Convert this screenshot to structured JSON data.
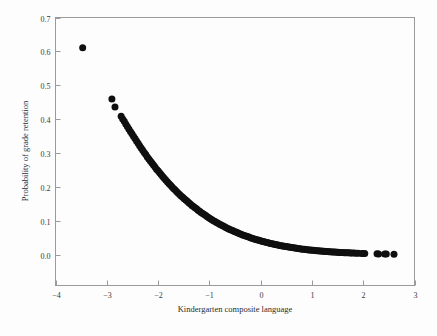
{
  "chart_data": {
    "type": "scatter",
    "title": "",
    "xlabel": "Kindergarten composite language",
    "ylabel": "Probability of grade retention",
    "xlim": [
      -4,
      3
    ],
    "ylim": [
      -0.09,
      0.7
    ],
    "xticks": [
      -4,
      -3,
      -2,
      -1,
      0,
      1,
      2,
      3
    ],
    "xticklabels": [
      "−4",
      "−3",
      "−2",
      "−1",
      "0",
      "1",
      "2",
      "3"
    ],
    "yticks": [
      0.0,
      0.1,
      0.2,
      0.3,
      0.4,
      0.5,
      0.6,
      0.7
    ],
    "yticklabels": [
      "0.0",
      "0.1",
      "0.2",
      "0.3",
      "0.4",
      "0.5",
      "0.6",
      "0.7"
    ],
    "grid": false,
    "legend": false,
    "marker": "filled-circle",
    "marker_color": "#100f0f",
    "marker_size": 4.6,
    "points": [
      [
        -3.47,
        0.611
      ],
      [
        -2.9,
        0.46
      ],
      [
        -2.84,
        0.436
      ],
      [
        -2.72,
        0.409
      ],
      [
        -2.69,
        0.401
      ],
      [
        -2.66,
        0.394
      ],
      [
        -2.63,
        0.386
      ],
      [
        -2.6,
        0.379
      ],
      [
        -2.57,
        0.371
      ],
      [
        -2.54,
        0.364
      ],
      [
        -2.51,
        0.357
      ],
      [
        -2.48,
        0.35
      ],
      [
        -2.45,
        0.343
      ],
      [
        -2.42,
        0.336
      ],
      [
        -2.39,
        0.329
      ],
      [
        -2.36,
        0.322
      ],
      [
        -2.33,
        0.315
      ],
      [
        -2.3,
        0.309
      ],
      [
        -2.27,
        0.302
      ],
      [
        -2.24,
        0.296
      ],
      [
        -2.21,
        0.289
      ],
      [
        -2.18,
        0.283
      ],
      [
        -2.15,
        0.277
      ],
      [
        -2.12,
        0.271
      ],
      [
        -2.09,
        0.265
      ],
      [
        -2.06,
        0.259
      ],
      [
        -2.03,
        0.253
      ],
      [
        -2.0,
        0.248
      ],
      [
        -1.97,
        0.242
      ],
      [
        -1.94,
        0.237
      ],
      [
        -1.91,
        0.231
      ],
      [
        -1.88,
        0.226
      ],
      [
        -1.85,
        0.221
      ],
      [
        -1.82,
        0.216
      ],
      [
        -1.79,
        0.211
      ],
      [
        -1.76,
        0.206
      ],
      [
        -1.73,
        0.201
      ],
      [
        -1.7,
        0.196
      ],
      [
        -1.67,
        0.192
      ],
      [
        -1.64,
        0.187
      ],
      [
        -1.61,
        0.183
      ],
      [
        -1.58,
        0.178
      ],
      [
        -1.55,
        0.174
      ],
      [
        -1.52,
        0.17
      ],
      [
        -1.49,
        0.166
      ],
      [
        -1.46,
        0.162
      ],
      [
        -1.43,
        0.158
      ],
      [
        -1.4,
        0.154
      ],
      [
        -1.37,
        0.15
      ],
      [
        -1.34,
        0.146
      ],
      [
        -1.31,
        0.143
      ],
      [
        -1.28,
        0.139
      ],
      [
        -1.25,
        0.136
      ],
      [
        -1.22,
        0.132
      ],
      [
        -1.19,
        0.129
      ],
      [
        -1.16,
        0.125
      ],
      [
        -1.13,
        0.122
      ],
      [
        -1.1,
        0.119
      ],
      [
        -1.07,
        0.116
      ],
      [
        -1.04,
        0.113
      ],
      [
        -1.01,
        0.11
      ],
      [
        -0.98,
        0.107
      ],
      [
        -0.95,
        0.104
      ],
      [
        -0.92,
        0.101
      ],
      [
        -0.89,
        0.0985
      ],
      [
        -0.86,
        0.0959
      ],
      [
        -0.83,
        0.0933
      ],
      [
        -0.8,
        0.0908
      ],
      [
        -0.77,
        0.0883
      ],
      [
        -0.74,
        0.0859
      ],
      [
        -0.71,
        0.0836
      ],
      [
        -0.68,
        0.0813
      ],
      [
        -0.65,
        0.079
      ],
      [
        -0.62,
        0.0768
      ],
      [
        -0.59,
        0.0747
      ],
      [
        -0.56,
        0.0726
      ],
      [
        -0.53,
        0.0705
      ],
      [
        -0.5,
        0.0685
      ],
      [
        -0.47,
        0.0666
      ],
      [
        -0.44,
        0.0647
      ],
      [
        -0.41,
        0.0628
      ],
      [
        -0.38,
        0.061
      ],
      [
        -0.35,
        0.0592
      ],
      [
        -0.32,
        0.0575
      ],
      [
        -0.29,
        0.0558
      ],
      [
        -0.26,
        0.0542
      ],
      [
        -0.23,
        0.0526
      ],
      [
        -0.2,
        0.051
      ],
      [
        -0.17,
        0.0495
      ],
      [
        -0.14,
        0.048
      ],
      [
        -0.11,
        0.0466
      ],
      [
        -0.08,
        0.0452
      ],
      [
        -0.05,
        0.0438
      ],
      [
        -0.02,
        0.0425
      ],
      [
        0.01,
        0.0412
      ],
      [
        0.04,
        0.0399
      ],
      [
        0.07,
        0.0387
      ],
      [
        0.1,
        0.0375
      ],
      [
        0.13,
        0.0364
      ],
      [
        0.16,
        0.0352
      ],
      [
        0.19,
        0.0341
      ],
      [
        0.22,
        0.0331
      ],
      [
        0.25,
        0.032
      ],
      [
        0.28,
        0.031
      ],
      [
        0.31,
        0.03
      ],
      [
        0.34,
        0.0291
      ],
      [
        0.37,
        0.0282
      ],
      [
        0.4,
        0.0273
      ],
      [
        0.43,
        0.0264
      ],
      [
        0.46,
        0.0256
      ],
      [
        0.49,
        0.0248
      ],
      [
        0.52,
        0.024
      ],
      [
        0.55,
        0.0232
      ],
      [
        0.58,
        0.0224
      ],
      [
        0.61,
        0.0217
      ],
      [
        0.64,
        0.021
      ],
      [
        0.67,
        0.0203
      ],
      [
        0.7,
        0.0197
      ],
      [
        0.73,
        0.019
      ],
      [
        0.76,
        0.0184
      ],
      [
        0.79,
        0.0178
      ],
      [
        0.82,
        0.0172
      ],
      [
        0.85,
        0.0166
      ],
      [
        0.88,
        0.0161
      ],
      [
        0.91,
        0.0155
      ],
      [
        0.94,
        0.015
      ],
      [
        0.97,
        0.0145
      ],
      [
        1.0,
        0.014
      ],
      [
        1.03,
        0.0136
      ],
      [
        1.06,
        0.0131
      ],
      [
        1.09,
        0.0127
      ],
      [
        1.12,
        0.0122
      ],
      [
        1.15,
        0.0118
      ],
      [
        1.18,
        0.0114
      ],
      [
        1.21,
        0.011
      ],
      [
        1.24,
        0.0107
      ],
      [
        1.27,
        0.0103
      ],
      [
        1.3,
        0.00997
      ],
      [
        1.33,
        0.00964
      ],
      [
        1.36,
        0.00931
      ],
      [
        1.39,
        0.009
      ],
      [
        1.42,
        0.0087
      ],
      [
        1.45,
        0.00841
      ],
      [
        1.48,
        0.00813
      ],
      [
        1.51,
        0.00785
      ],
      [
        1.54,
        0.00759
      ],
      [
        1.57,
        0.00734
      ],
      [
        1.6,
        0.00709
      ],
      [
        1.63,
        0.00685
      ],
      [
        1.66,
        0.00662
      ],
      [
        1.69,
        0.0064
      ],
      [
        1.72,
        0.00619
      ],
      [
        1.75,
        0.00598
      ],
      [
        1.78,
        0.00578
      ],
      [
        1.82,
        0.00552
      ],
      [
        1.86,
        0.00528
      ],
      [
        1.9,
        0.00504
      ],
      [
        1.97,
        0.00465
      ],
      [
        2.0,
        0.00449
      ],
      [
        2.03,
        0.00434
      ],
      [
        2.27,
        0.00328
      ],
      [
        2.3,
        0.00317
      ],
      [
        2.42,
        0.00275
      ],
      [
        2.45,
        0.00266
      ],
      [
        2.6,
        0.00226
      ]
    ]
  },
  "figure": {
    "background_color": "#fdfdfd",
    "axis_color": "#9a9a9a",
    "text_color": "#2b2b2b"
  }
}
